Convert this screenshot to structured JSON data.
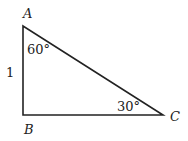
{
  "diagram": {
    "type": "right-triangle",
    "vertices": {
      "A": {
        "label": "A",
        "x": 23,
        "y": 26
      },
      "B": {
        "label": "B",
        "x": 23,
        "y": 115
      },
      "C": {
        "label": "C",
        "x": 163,
        "y": 115
      }
    },
    "angles": {
      "A": "60°",
      "C": "30°"
    },
    "sides": {
      "AB": "1"
    },
    "colors": {
      "line": "#222222",
      "background": "#ffffff"
    }
  }
}
